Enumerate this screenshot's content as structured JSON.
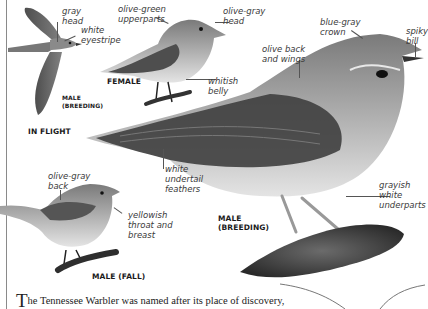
{
  "figures": [
    {
      "id": "in-flight",
      "caption": "IN FLIGHT",
      "sub_caption": "MALE\n(BREEDING)",
      "labels": [
        "gray\nhead",
        "white\neyestripe"
      ]
    },
    {
      "id": "female",
      "caption": "FEMALE",
      "labels": [
        "olive-green\nupperparts",
        "olive-gray\nhead",
        "whitish\nbelly"
      ]
    },
    {
      "id": "male-breeding",
      "caption": "MALE\n(BREEDING)",
      "labels": [
        "blue-gray\ncrown",
        "spiky\nbill",
        "olive back\nand wings",
        "white\nundertail\nfeathers",
        "grayish white\nunderparts"
      ]
    },
    {
      "id": "male-fall",
      "caption": "MALE (FALL)",
      "labels": [
        "olive-gray\nback",
        "yellowish\nthroat and\nbreast"
      ]
    }
  ],
  "body": {
    "drop_cap": "T",
    "text": "he Tennessee Warbler was named after its place of discovery,"
  },
  "colors": {
    "ink": "#3a3a3a",
    "rule": "#8a8a8a",
    "bird_dark": "#4a4a4a",
    "bird_mid": "#8c8c8c",
    "bird_light": "#cfcfcf"
  }
}
